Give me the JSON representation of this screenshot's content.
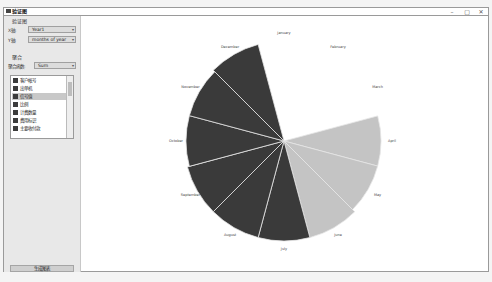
{
  "window": {
    "title": "验证图",
    "controls": {
      "minimize": "–",
      "maximize": "▢",
      "close": "✕"
    }
  },
  "sidebar": {
    "axes_group": {
      "label": "验证图",
      "x_label": "X轴:",
      "x_value": "Year1",
      "y_label": "Y轴:",
      "y_value": "months of year"
    },
    "aggregate_group": {
      "label": "聚合",
      "func_label": "聚合函数:",
      "func_value": "Sum",
      "items": [
        {
          "label": "客户帐号",
          "selected": false
        },
        {
          "label": "出单机",
          "selected": false
        },
        {
          "label": "信号值",
          "selected": true
        },
        {
          "label": "比例",
          "selected": false
        },
        {
          "label": "计费数量",
          "selected": false
        },
        {
          "label": "费用标识",
          "selected": false
        },
        {
          "label": "主要收付款",
          "selected": false
        }
      ]
    },
    "bottom_button": "生成图表"
  },
  "chart_data": {
    "type": "polar-area",
    "categories": [
      "January",
      "February",
      "March",
      "April",
      "May",
      "June",
      "July",
      "August",
      "September",
      "October",
      "November",
      "December"
    ],
    "values": [
      0,
      0,
      0,
      97,
      97,
      100,
      100,
      100,
      100,
      98,
      98,
      100
    ],
    "colors": [
      "#cccccc",
      "#cccccc",
      "#cccccc",
      "#c4c4c4",
      "#c4c4c4",
      "#c4c4c4",
      "#3a3a3a",
      "#3a3a3a",
      "#3a3a3a",
      "#3a3a3a",
      "#3a3a3a",
      "#3a3a3a"
    ],
    "start_angle_deg": -15,
    "title": "",
    "legend": "none"
  }
}
